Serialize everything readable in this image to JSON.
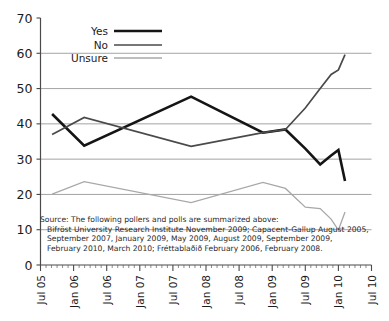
{
  "chart_data": {
    "type": "line",
    "title": "",
    "subtitle": "",
    "xlabel": "",
    "ylabel": "",
    "ylim": [
      0,
      70
    ],
    "ytick_step": 10,
    "yticks": [
      "0",
      "10",
      "20",
      "30",
      "40",
      "50",
      "60",
      "70"
    ],
    "xticks": [
      "Jul 05",
      "Jan 06",
      "Jul 06",
      "Jan 07",
      "Jul 07",
      "Jan 08",
      "Jul 08",
      "Jan 09",
      "Jul 09",
      "Jan 10",
      "Jul 10"
    ],
    "xlim": [
      "Jul 05",
      "Jul 10"
    ],
    "grid": "horizontal",
    "legend_position": "top-left-inside",
    "series": [
      {
        "name": "Yes",
        "color": "#151515",
        "width": 2.6,
        "x": [
          "Aug 2005",
          "Feb 2006",
          "Sep 2007",
          "Nov 2009",
          "Jan 2009",
          "May 2009",
          "Aug 2009",
          "Sep 2009",
          "Feb 2010",
          "Mar 2010"
        ],
        "x_frac": [
          0.035,
          0.132,
          0.455,
          0.672,
          0.74,
          0.8,
          0.845,
          0.878,
          0.9,
          0.92
        ],
        "values": [
          42.8,
          33.8,
          47.7,
          37.5,
          38.4,
          33.0,
          28.5,
          31.0,
          32.6,
          23.8
        ]
      },
      {
        "name": "No",
        "color": "#4a4a4a",
        "width": 1.7,
        "x": [
          "Aug 2005",
          "Feb 2006",
          "Sep 2007",
          "Nov 2009",
          "Jan 2009",
          "May 2009",
          "Aug 2009",
          "Sep 2009",
          "Feb 2010",
          "Mar 2010"
        ],
        "x_frac": [
          0.035,
          0.132,
          0.455,
          0.672,
          0.74,
          0.8,
          0.845,
          0.878,
          0.9,
          0.92
        ],
        "values": [
          37.0,
          41.8,
          33.6,
          37.5,
          38.4,
          44.5,
          50.0,
          54.0,
          55.3,
          59.6
        ]
      },
      {
        "name": "Unsure",
        "color": "#a8a8a8",
        "width": 1.3,
        "x": [
          "Aug 2005",
          "Feb 2006",
          "Sep 2007",
          "Nov 2009",
          "Jan 2009",
          "May 2009",
          "Aug 2009",
          "Sep 2009",
          "Feb 2010",
          "Mar 2010"
        ],
        "x_frac": [
          0.035,
          0.132,
          0.455,
          0.672,
          0.74,
          0.8,
          0.845,
          0.878,
          0.9,
          0.92
        ],
        "values": [
          20.1,
          23.6,
          17.7,
          23.4,
          21.7,
          16.4,
          16.0,
          13.0,
          9.9,
          15.0
        ]
      }
    ],
    "annotation": {
      "lines": [
        "Source: The following pollers and polls are summarized above:",
        "Bifröst University Research Institute November 2009; Capacent-Gallup August 2005,",
        "September 2007, January 2009, May 2009, August 2009, September 2009,",
        "February 2010, March 2010; Fréttablaðið February 2006, February 2008."
      ]
    }
  },
  "legend": {
    "items": [
      {
        "label": "Yes"
      },
      {
        "label": "No"
      },
      {
        "label": "Unsure"
      }
    ]
  }
}
